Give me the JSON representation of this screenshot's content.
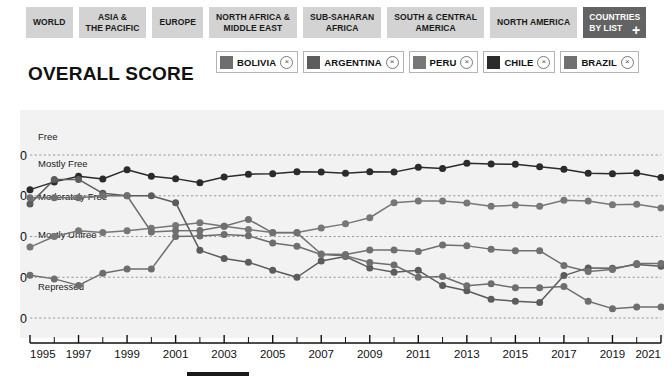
{
  "regions": {
    "tabs": [
      {
        "name": "region-tab-world",
        "line1": "WORLD",
        "line2": "",
        "active": false
      },
      {
        "name": "region-tab-asia-pacific",
        "line1": "ASIA &",
        "line2": "THE PACIFIC",
        "active": false
      },
      {
        "name": "region-tab-europe",
        "line1": "EUROPE",
        "line2": "",
        "active": false
      },
      {
        "name": "region-tab-north-africa-middle-east",
        "line1": "NORTH AFRICA &",
        "line2": "MIDDLE EAST",
        "active": false
      },
      {
        "name": "region-tab-sub-saharan-africa",
        "line1": "SUB-SAHARAN",
        "line2": "AFRICA",
        "active": false
      },
      {
        "name": "region-tab-south-central-america",
        "line1": "SOUTH & CENTRAL",
        "line2": "AMERICA",
        "active": false
      },
      {
        "name": "region-tab-north-america",
        "line1": "NORTH AMERICA",
        "line2": "",
        "active": false
      },
      {
        "name": "region-tab-countries-by-list",
        "line1": "COUNTRIES",
        "line2": "BY LIST",
        "active": true,
        "plus": "+"
      }
    ]
  },
  "title": "OVERALL SCORE",
  "legend": {
    "close_glyph": "×",
    "items": [
      {
        "label": "BOLIVIA",
        "color": "#6e6e6e"
      },
      {
        "label": "ARGENTINA",
        "color": "#5c5c5c"
      },
      {
        "label": "PERU",
        "color": "#777777"
      },
      {
        "label": "CHILE",
        "color": "#2b2b2b"
      },
      {
        "label": "BRAZIL",
        "color": "#707070"
      }
    ]
  },
  "chart_data": {
    "type": "line",
    "title": "OVERALL SCORE",
    "xlabel": "",
    "ylabel": "",
    "xlim": [
      1995,
      2021
    ],
    "ylim": [
      37,
      86
    ],
    "grid": true,
    "legend_position": "top",
    "y_ticks": [
      40,
      50,
      60,
      70,
      80
    ],
    "x_ticks": [
      1995,
      1996,
      1997,
      1998,
      1999,
      2000,
      2001,
      2002,
      2003,
      2004,
      2005,
      2006,
      2007,
      2008,
      2009,
      2010,
      2011,
      2012,
      2013,
      2014,
      2015,
      2016,
      2017,
      2018,
      2019,
      2020,
      2021
    ],
    "x_tick_labels": [
      1995,
      1997,
      1999,
      2001,
      2003,
      2005,
      2007,
      2009,
      2011,
      2013,
      2015,
      2017,
      2019,
      2021
    ],
    "bands": [
      {
        "label": "Free",
        "from": 80,
        "to": 100
      },
      {
        "label": "Mostly Free",
        "from": 70,
        "to": 80
      },
      {
        "label": "Moderately Free",
        "from": 60,
        "to": 70
      },
      {
        "label": "Mostly Unfree",
        "from": 50,
        "to": 60
      },
      {
        "label": "Repressed",
        "from": 0,
        "to": 50
      }
    ],
    "x": [
      1995,
      1996,
      1997,
      1998,
      1999,
      2000,
      2001,
      2002,
      2003,
      2004,
      2005,
      2006,
      2007,
      2008,
      2009,
      2010,
      2011,
      2012,
      2013,
      2014,
      2015,
      2016,
      2017,
      2018,
      2019,
      2020,
      2021
    ],
    "series": [
      {
        "name": "CHILE",
        "color": "#2b2b2b",
        "values": [
          71.5,
          73.4,
          74.8,
          74.1,
          76.4,
          74.8,
          74.2,
          73.2,
          74.6,
          75.3,
          75.4,
          75.9,
          75.8,
          75.5,
          75.9,
          75.8,
          77.0,
          76.7,
          78.0,
          77.8,
          77.7,
          77.1,
          76.5,
          75.5,
          75.4,
          75.6,
          74.5
        ]
      },
      {
        "name": "PERU",
        "color": "#777777",
        "values": [
          57.4,
          60.0,
          61.4,
          61.0,
          61.4,
          62.0,
          62.7,
          63.4,
          62.5,
          61.7,
          61.0,
          61.0,
          62.1,
          63.1,
          64.6,
          68.3,
          68.7,
          68.7,
          68.2,
          67.4,
          67.7,
          67.4,
          68.9,
          68.7,
          67.8,
          67.9,
          67.0
        ]
      },
      {
        "name": "ARGENTINA",
        "color": "#5c5c5c",
        "values": [
          68.0,
          74.0,
          74.0,
          70.6,
          70.0,
          70.0,
          68.3,
          56.6,
          54.6,
          53.7,
          51.7,
          50.0,
          54.0,
          55.1,
          52.3,
          51.2,
          51.7,
          48.0,
          46.7,
          44.6,
          44.1,
          43.8,
          50.4,
          52.3,
          52.2,
          53.1,
          52.7
        ]
      },
      {
        "name": "BOLIVIA",
        "color": "#6e6e6e",
        "values": [
          50.5,
          49.6,
          48.0,
          51.0,
          52.0,
          52.0,
          60.0,
          60.1,
          60.5,
          60.2,
          58.4,
          57.6,
          55.6,
          55.3,
          53.6,
          53.0,
          50.0,
          50.2,
          47.9,
          48.4,
          47.4,
          47.4,
          47.7,
          44.1,
          42.3,
          42.7,
          42.7
        ]
      },
      {
        "name": "BRAZIL",
        "color": "#707070",
        "values": [
          69.5,
          69.5,
          69.5,
          70.0,
          70.0,
          61.1,
          61.4,
          61.5,
          62.5,
          64.2,
          60.9,
          60.9,
          55.7,
          55.6,
          56.7,
          56.7,
          56.3,
          57.9,
          57.7,
          56.9,
          56.5,
          56.5,
          52.9,
          51.4,
          51.9,
          53.4,
          53.4
        ]
      }
    ]
  }
}
